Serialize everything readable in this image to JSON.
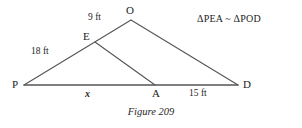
{
  "figure": {
    "caption": "Figure 209",
    "similarity_statement": "ΔPEA ~ ΔPOD",
    "background_color": "#ffffff",
    "line_color": "#555555",
    "text_color": "#1c1c1c",
    "vertices": [
      {
        "name": "P",
        "label": "P",
        "x": 24,
        "y": 85
      },
      {
        "name": "E",
        "label": "E",
        "x": 95,
        "y": 42
      },
      {
        "name": "O",
        "label": "O",
        "x": 131,
        "y": 20
      },
      {
        "name": "A",
        "label": "A",
        "x": 155,
        "y": 85
      },
      {
        "name": "D",
        "label": "D",
        "x": 238,
        "y": 85
      }
    ],
    "segments": [
      {
        "name": "segment-P-O",
        "from": "P",
        "to": "O",
        "x1": 24,
        "y1": 85,
        "x2": 131,
        "y2": 20
      },
      {
        "name": "segment-O-D",
        "from": "O",
        "to": "D",
        "x1": 131,
        "y1": 20,
        "x2": 238,
        "y2": 85
      },
      {
        "name": "segment-P-D",
        "from": "P",
        "to": "D",
        "x1": 24,
        "y1": 85,
        "x2": 238,
        "y2": 85
      },
      {
        "name": "segment-E-A",
        "from": "E",
        "to": "A",
        "x1": 95,
        "y1": 42,
        "x2": 155,
        "y2": 85
      }
    ],
    "measures": [
      {
        "name": "measure-EO",
        "segment": "E-O",
        "text": "9 ft",
        "value": 9,
        "unit": "ft"
      },
      {
        "name": "measure-PE",
        "segment": "P-E",
        "text": "18 ft",
        "value": 18,
        "unit": "ft"
      },
      {
        "name": "measure-PA",
        "segment": "P-A",
        "text": "x",
        "value": null,
        "unit": "ft"
      },
      {
        "name": "measure-AD",
        "segment": "A-D",
        "text": "15 ft",
        "value": 15,
        "unit": "ft"
      }
    ]
  }
}
